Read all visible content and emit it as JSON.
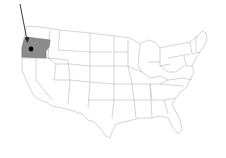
{
  "map": {
    "title": "United States map with Oregon highlighted",
    "highlighted_state": "Oregon",
    "highlight_color": "#8c8c8c",
    "border_color": "#b8b8b8",
    "background": "#ffffff",
    "marker": {
      "label": "capital",
      "color": "#000000"
    },
    "arrow": {
      "color": "#222222",
      "target": "Oregon"
    }
  }
}
